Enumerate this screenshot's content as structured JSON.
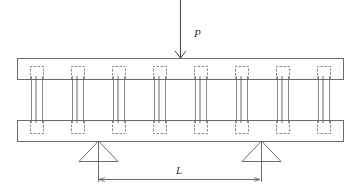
{
  "diagram": {
    "type": "beam-with-shear-connectors",
    "load": {
      "label": "P",
      "x": 180,
      "y_top": 0,
      "y_bottom": 58
    },
    "span": {
      "label": "L",
      "x1": 99,
      "x2": 260,
      "y": 179
    },
    "top_beam": {
      "x": 17,
      "y": 58,
      "width": 326,
      "height": 21
    },
    "bottom_beam": {
      "x": 17,
      "y": 120,
      "width": 326,
      "height": 21
    },
    "connectors": [
      {
        "cx": 37
      },
      {
        "cx": 78
      },
      {
        "cx": 119
      },
      {
        "cx": 160
      },
      {
        "cx": 201
      },
      {
        "cx": 242
      },
      {
        "cx": 283
      },
      {
        "cx": 324
      }
    ],
    "supports": [
      {
        "apex_x": 98,
        "apex_y": 141,
        "base_y": 161,
        "half_width": 19
      },
      {
        "apex_x": 261,
        "apex_y": 141,
        "base_y": 161,
        "half_width": 19
      }
    ],
    "colors": {
      "line": "#6b6b6b",
      "dark": "#444444"
    }
  }
}
